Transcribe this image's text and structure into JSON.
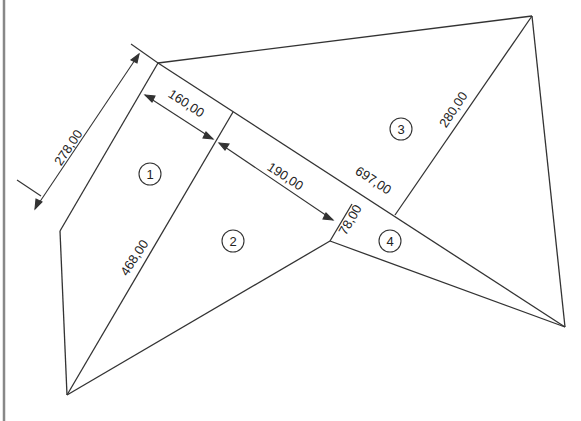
{
  "diagram": {
    "type": "land-plot-subdivision",
    "colors": {
      "line": "#333333",
      "text": "#222222",
      "background": "#ffffff",
      "border": "#888888"
    },
    "vertices": {
      "A": [
        158,
        63
      ],
      "B": [
        532,
        16
      ],
      "C": [
        565,
        327
      ],
      "D": [
        67,
        395
      ],
      "E": [
        60,
        231
      ],
      "F": [
        330,
        241
      ],
      "G": [
        233,
        112
      ],
      "H": [
        352,
        204
      ],
      "I": [
        395,
        215
      ]
    },
    "dimensions": [
      {
        "id": "d278",
        "label": "278,00",
        "x": 72,
        "y": 150,
        "angle": -56
      },
      {
        "id": "d160",
        "label": "160,00",
        "x": 184,
        "y": 107,
        "angle": 33
      },
      {
        "id": "d190",
        "label": "190,00",
        "x": 283,
        "y": 180,
        "angle": 33
      },
      {
        "id": "d697",
        "label": "697,00",
        "x": 371,
        "y": 184,
        "angle": 33
      },
      {
        "id": "d280",
        "label": "280,00",
        "x": 457,
        "y": 112,
        "angle": -56
      },
      {
        "id": "d468",
        "label": "468,00",
        "x": 138,
        "y": 260,
        "angle": -57
      },
      {
        "id": "d78",
        "label": "78,00",
        "x": 354,
        "y": 222,
        "angle": -60
      }
    ],
    "parcels": [
      {
        "id": "p1",
        "label": "1",
        "x": 150,
        "y": 174
      },
      {
        "id": "p2",
        "label": "2",
        "x": 233,
        "y": 241
      },
      {
        "id": "p3",
        "label": "3",
        "x": 401,
        "y": 129
      },
      {
        "id": "p4",
        "label": "4",
        "x": 390,
        "y": 241
      }
    ]
  }
}
